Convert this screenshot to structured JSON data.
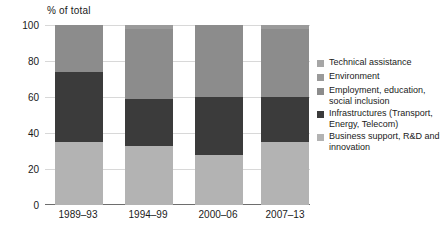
{
  "chart_data": {
    "type": "bar",
    "subtype": "stacked-bar-100",
    "title": "",
    "axis_note": "% of total",
    "xlabel": "",
    "ylabel": "% of total",
    "ylim": [
      0,
      100
    ],
    "yticks": [
      0,
      20,
      40,
      60,
      80,
      100
    ],
    "grid": true,
    "legend_position": "right",
    "categories": [
      "1989–93",
      "1994–99",
      "2000–06",
      "2007–13"
    ],
    "series": [
      {
        "name": "Business support, R&D and innovation",
        "color": "#b3b3b3",
        "values": [
          35,
          33,
          28,
          35
        ]
      },
      {
        "name": "Infrastructures (Transport, Energy, Telecom)",
        "color": "#3b3b3b",
        "values": [
          39,
          26,
          32,
          25
        ]
      },
      {
        "name": "Employment, education, social inclusion",
        "color": "#8c8c8c",
        "values": [
          26,
          39,
          40,
          38
        ]
      },
      {
        "name": "Environment",
        "color": "#9a9a9a",
        "values": [
          0,
          2,
          0,
          2
        ]
      },
      {
        "name": "Technical assistance",
        "color": "#a6a6a6",
        "values": [
          0,
          0,
          0,
          0
        ]
      }
    ]
  },
  "legend": {
    "items": [
      {
        "label": "Technical assistance",
        "color": "#a6a6a6"
      },
      {
        "label": "Environment",
        "color": "#9a9a9a"
      },
      {
        "label": "Employment, education, social inclusion",
        "color": "#8c8c8c"
      },
      {
        "label": "Infrastructures (Transport, Energy, Telecom)",
        "color": "#3b3b3b"
      },
      {
        "label": "Business support, R&D and innovation",
        "color": "#b3b3b3"
      }
    ]
  },
  "axes": {
    "y_unit_label": "% of total",
    "yticks": [
      "100",
      "80",
      "60",
      "40",
      "20",
      "0"
    ],
    "xticks": [
      "1989–93",
      "1994–99",
      "2000–06",
      "2007–13"
    ]
  },
  "colors": {
    "background": "#ffffff",
    "grid": "#d8d8d8",
    "axis": "#6e6e6e",
    "text": "#1a1a1a"
  }
}
